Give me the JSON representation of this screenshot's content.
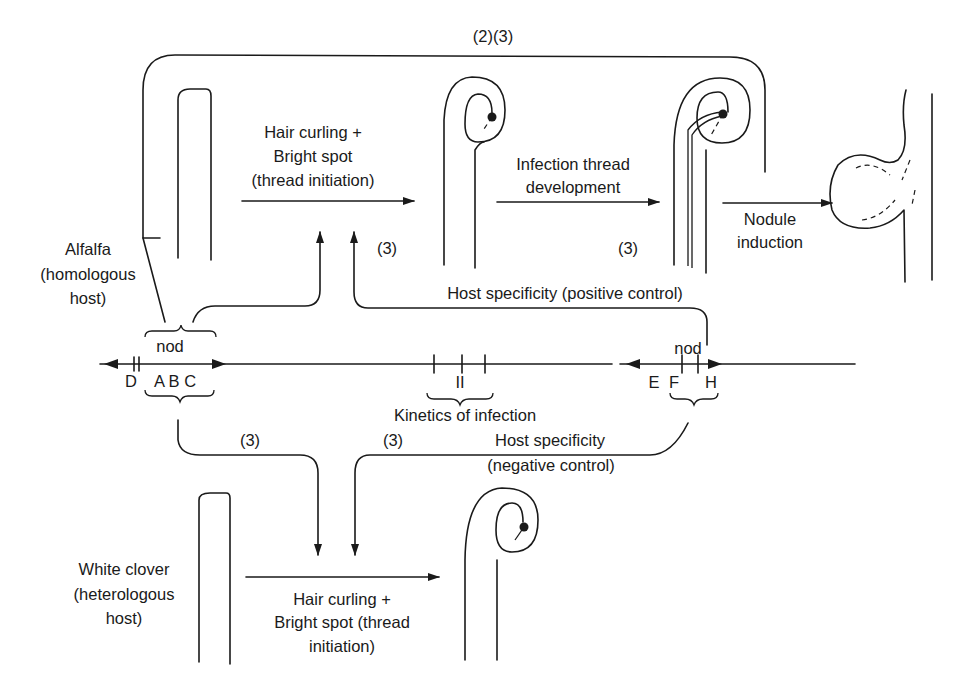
{
  "labels": {
    "top_refs": "(2)(3)",
    "alfalfa": [
      "Alfalfa",
      "(homologous",
      "host)"
    ],
    "hair_curling_top": [
      "Hair curling +",
      "Bright spot",
      "(thread initiation)"
    ],
    "infection_thread": [
      "Infection thread",
      "development"
    ],
    "nodule_induction": [
      "Nodule",
      "induction"
    ],
    "ref3_a": "(3)",
    "ref3_b": "(3)",
    "host_specificity_positive": "Host specificity (positive control)",
    "nod_left": "nod",
    "nod_right": "nod",
    "genes_left": "D ABC",
    "gene_D": "D",
    "gene_ABC": "A B C",
    "region_II": "II",
    "genes_right_E": "E",
    "genes_right_F": "F",
    "genes_right_H": "H",
    "kinetics": "Kinetics of infection",
    "ref3_c": "(3)",
    "ref3_d": "(3)",
    "host_specificity_negative": "Host specificity",
    "negative_control": "(negative control)",
    "white_clover": [
      "White clover",
      "(heterologous",
      "host)"
    ],
    "hair_curling_bottom": [
      "Hair curling +",
      "Bright spot (thread",
      "initiation)"
    ]
  }
}
